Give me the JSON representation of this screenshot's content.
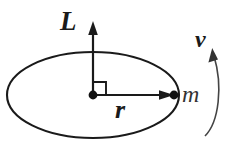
{
  "figure": {
    "background_color": "#ffffff",
    "stroke_color": "#1a1a1a",
    "labels": {
      "angular_momentum": "L",
      "radius": "r",
      "mass": "m",
      "velocity": "v"
    },
    "elements": {
      "orbit_path": "ellipse",
      "center_point": "dot",
      "mass_point": "dot",
      "right_angle_marker": "square",
      "angular_momentum_vector": "vertical-arrow-up",
      "radius_vector": "horizontal-arrow-right",
      "velocity_indicator": "curved-arrow-counterclockwise"
    },
    "geometry": {
      "ellipse_center_x": 93,
      "ellipse_center_y": 95,
      "ellipse_radius_x": 86,
      "ellipse_radius_y": 43,
      "arrow_up_tip_y": 22,
      "radius_arrow_tip_x": 173
    }
  }
}
